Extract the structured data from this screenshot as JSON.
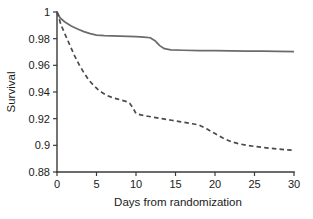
{
  "chart_data": {
    "type": "line",
    "title": "",
    "xlabel": "Days from randomization",
    "ylabel": "Survival",
    "xlim": [
      0,
      30
    ],
    "ylim": [
      0.88,
      1
    ],
    "grid": false,
    "legend": "none",
    "xticks": [
      0,
      5,
      10,
      15,
      20,
      25,
      30
    ],
    "xtick_labels": [
      "0",
      "5",
      "10",
      "15",
      "20",
      "25",
      "30"
    ],
    "yticks": [
      0.88,
      0.9,
      0.92,
      0.94,
      0.96,
      0.98,
      1
    ],
    "ytick_labels": [
      "0.88",
      "0.9",
      "0.92",
      "0.94",
      "0.96",
      "0.98",
      "1"
    ],
    "series": [
      {
        "name": "solid-curve",
        "style": "solid",
        "color": "#6b6b6b",
        "x": [
          0,
          0.4,
          1,
          1.8,
          2.6,
          3.4,
          4.2,
          5,
          6,
          7,
          8,
          9,
          10,
          11,
          11.8,
          12.4,
          13,
          13.6,
          14.4,
          16,
          18,
          20,
          22,
          24,
          26,
          28,
          30
        ],
        "y": [
          1,
          0.9955,
          0.9925,
          0.9895,
          0.9872,
          0.9853,
          0.9838,
          0.9827,
          0.9823,
          0.9821,
          0.9819,
          0.9817,
          0.9815,
          0.9812,
          0.9807,
          0.9785,
          0.9748,
          0.9725,
          0.9716,
          0.9713,
          0.9711,
          0.971,
          0.9709,
          0.9707,
          0.9706,
          0.9705,
          0.9703
        ]
      },
      {
        "name": "dashed-curve",
        "style": "dashed",
        "color": "#4a4a4a",
        "x": [
          0,
          0.5,
          1,
          1.6,
          2.2,
          2.8,
          3.4,
          4,
          4.6,
          5.2,
          5.8,
          6.4,
          7,
          7.6,
          8.2,
          8.8,
          9.2,
          9.6,
          10,
          10.6,
          11.5,
          12.5,
          13.5,
          14.5,
          15.5,
          16.5,
          17.5,
          18,
          19,
          20,
          21,
          22,
          23,
          24,
          25,
          26,
          27,
          28,
          29,
          30
        ],
        "y": [
          1,
          0.9905,
          0.9835,
          0.9755,
          0.9675,
          0.9605,
          0.9545,
          0.9492,
          0.9452,
          0.9418,
          0.9392,
          0.9372,
          0.9358,
          0.9348,
          0.9338,
          0.9328,
          0.9315,
          0.9282,
          0.9238,
          0.9228,
          0.9218,
          0.9208,
          0.9198,
          0.9188,
          0.9178,
          0.9168,
          0.9158,
          0.9152,
          0.9122,
          0.9088,
          0.9055,
          0.9028,
          0.9012,
          0.9,
          0.8992,
          0.8985,
          0.8978,
          0.8972,
          0.8967,
          0.8963
        ]
      }
    ]
  }
}
